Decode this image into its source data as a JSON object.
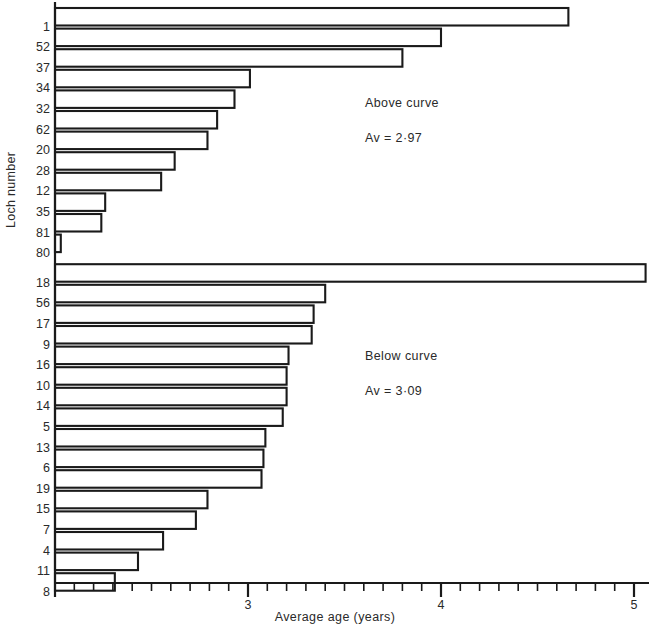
{
  "chart_data": {
    "type": "bar",
    "orientation": "horizontal",
    "title": "",
    "xlabel": "Average age  (years)",
    "ylabel": "Loch number",
    "xlim": [
      2.0,
      5.12
    ],
    "xticks_major": [
      3,
      4,
      5
    ],
    "xtick_labels": [
      "3",
      "4",
      "5"
    ],
    "xticks_minor_step": 0.1,
    "grid": false,
    "legend": false,
    "groups": [
      {
        "name": "Above curve",
        "annotation_label": "Above curve",
        "annotation_value": "Av = 2·97",
        "average": 2.97,
        "categories": [
          "1",
          "52",
          "37",
          "34",
          "32",
          "62",
          "20",
          "28",
          "12",
          "35",
          "81",
          "80"
        ],
        "values": [
          4.66,
          4.0,
          3.8,
          3.01,
          2.93,
          2.84,
          2.79,
          2.62,
          2.55,
          2.26,
          2.24,
          2.03
        ]
      },
      {
        "name": "Below curve",
        "annotation_label": "Below curve",
        "annotation_value": "Av = 3·09",
        "average": 3.09,
        "categories": [
          "18",
          "56",
          "17",
          "9",
          "16",
          "10",
          "14",
          "5",
          "13",
          "6",
          "19",
          "15",
          "7",
          "4",
          "11",
          "8"
        ],
        "values": [
          5.06,
          3.4,
          3.34,
          3.33,
          3.21,
          3.2,
          3.2,
          3.18,
          3.09,
          3.08,
          3.07,
          2.79,
          2.73,
          2.56,
          2.43,
          2.31
        ]
      }
    ]
  },
  "colors": {
    "ink": "#1a1a1a",
    "bar_fill": "#ffffff",
    "bar_stroke": "#1a1a1a",
    "background": "#ffffff"
  },
  "axis": {
    "y_label_text": "Loch number",
    "x_label_text": "Average age  (years)"
  }
}
